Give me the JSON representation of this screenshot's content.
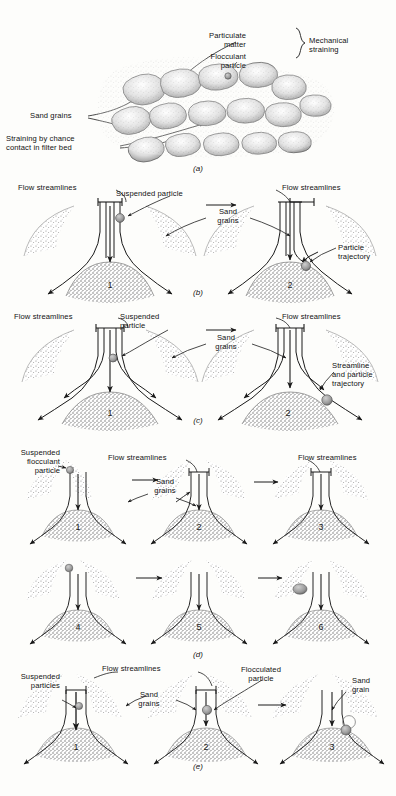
{
  "figure": {
    "background_color": "#fdfdfb",
    "ink_color": "#171717",
    "grain_color": "#8d8d8d",
    "particle_color": "#9a9a9a"
  },
  "panels": [
    {
      "id": "a",
      "letter": "(a)",
      "caption": "Mechanical straining in sand grain bed",
      "labels": [
        {
          "name": "particulate-matter",
          "text": "Particulate\nmatter"
        },
        {
          "name": "flocculant-particle",
          "text": "Flocculant\nparticle"
        },
        {
          "name": "mechanical-straining",
          "text": "Mechanical\nstraining"
        },
        {
          "name": "sand-grains",
          "text": "Sand grains"
        },
        {
          "name": "straining-by-chance-contact",
          "text": "Straining by chance\ncontact in filter bed"
        }
      ],
      "brace": true
    },
    {
      "id": "b",
      "letter": "(b)",
      "caption": "Sedimentation / interception of suspended particle",
      "cells": [
        "1",
        "2"
      ],
      "labels": [
        {
          "name": "flow-streamlines-left",
          "text": "Flow streamlines"
        },
        {
          "name": "suspended-particle",
          "text": "Suspended particle"
        },
        {
          "name": "sand-grains",
          "text": "Sand\ngrains"
        },
        {
          "name": "flow-streamlines-right",
          "text": "Flow streamlines"
        },
        {
          "name": "particle-trajectory",
          "text": "Particle\ntrajectory"
        }
      ]
    },
    {
      "id": "c",
      "letter": "(c)",
      "caption": "Interception along streamline",
      "cells": [
        "1",
        "2"
      ],
      "labels": [
        {
          "name": "flow-streamlines-left",
          "text": "Flow streamlines"
        },
        {
          "name": "suspended-particle",
          "text": "Suspended\nparticle"
        },
        {
          "name": "sand-grains",
          "text": "Sand\ngrains"
        },
        {
          "name": "flow-streamlines-right",
          "text": "Flow streamlines"
        },
        {
          "name": "streamline-and-particle-trajectory",
          "text": "Streamline\nand particle\ntrajectory"
        }
      ]
    },
    {
      "id": "d",
      "letter": "(d)",
      "caption": "Adhesion sequence of suspended flocculant particle",
      "cells": [
        "1",
        "2",
        "3",
        "4",
        "5",
        "6"
      ],
      "labels": [
        {
          "name": "suspended-flocculant-particle",
          "text": "Suspended\nflocculant\nparticle"
        },
        {
          "name": "flow-streamlines-mid",
          "text": "Flow streamlines"
        },
        {
          "name": "sand-grains",
          "text": "Sand\ngrains"
        },
        {
          "name": "flow-streamlines-right",
          "text": "Flow streamlines"
        }
      ]
    },
    {
      "id": "e",
      "letter": "(e)",
      "caption": "Flocculation of suspended particles onto sand grain",
      "cells": [
        "1",
        "2",
        "3"
      ],
      "labels": [
        {
          "name": "suspended-particles",
          "text": "Suspended\nparticles"
        },
        {
          "name": "flow-streamlines",
          "text": "Flow streamlines"
        },
        {
          "name": "sand-grains",
          "text": "Sand\ngrains"
        },
        {
          "name": "flocculated-particle",
          "text": "Flocculated\nparticle"
        },
        {
          "name": "sand-grain",
          "text": "Sand\ngrain"
        }
      ]
    }
  ]
}
